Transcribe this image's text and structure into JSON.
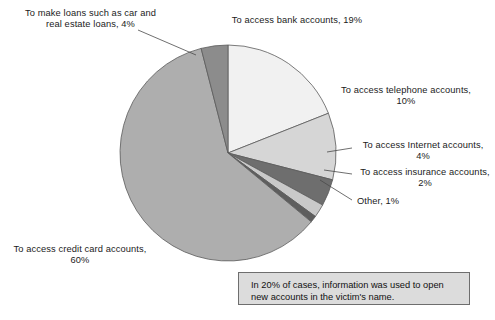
{
  "chart_data": {
    "type": "pie",
    "title": "",
    "categories": [
      "To access bank accounts",
      "To access telephone accounts",
      "To access Internet accounts",
      "To access insurance accounts",
      "Other",
      "To access credit card accounts",
      "To make loans such as car and real estate loans"
    ],
    "values": [
      19,
      10,
      4,
      2,
      1,
      60,
      4
    ],
    "unit": "%",
    "start_angle_deg": 0,
    "direction": "clockwise",
    "legend": "none",
    "grid": false,
    "labels_inline": true,
    "colors": [
      "#f1f1f1",
      "#d6d6d6",
      "#6e6e6e",
      "#c9c9c9",
      "#5e5e5e",
      "#aeaeae",
      "#8c8c8c"
    ],
    "slices": [
      {
        "label": "To access bank accounts",
        "value": 19,
        "color": "#f1f1f1"
      },
      {
        "label": "To access telephone accounts",
        "value": 10,
        "color": "#d6d6d6"
      },
      {
        "label": "To access Internet accounts",
        "value": 4,
        "color": "#6e6e6e"
      },
      {
        "label": "To access insurance accounts",
        "value": 2,
        "color": "#c9c9c9"
      },
      {
        "label": "Other",
        "value": 1,
        "color": "#5e5e5e"
      },
      {
        "label": "To access credit card accounts",
        "value": 60,
        "color": "#aeaeae"
      },
      {
        "label": "To make loans such as car and real estate loans",
        "value": 4,
        "color": "#8c8c8c"
      }
    ],
    "annotations": [
      "In 20% of cases, information was used to open new accounts in the victim's name."
    ]
  },
  "labels": {
    "loans": "To make loans such as car and\nreal estate loans, 4%",
    "bank": "To access bank accounts, 19%",
    "telephone": "To access telephone accounts,\n10%",
    "internet": "To access Internet accounts,\n4%",
    "insurance": "To access insurance accounts,\n2%",
    "other": "Other, 1%",
    "credit": "To access credit card accounts,\n60%"
  },
  "callout": {
    "text": "In 20% of cases, information was used to open new accounts in the victim's name."
  },
  "style": {
    "outline_color": "#5a5a5a",
    "background": "#ffffff",
    "callout_fill": "#dcdcdc",
    "callout_border": "#6e6e6e"
  }
}
